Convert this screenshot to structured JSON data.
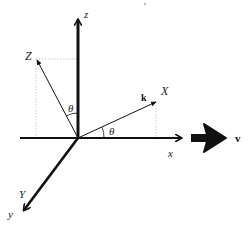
{
  "diagram": {
    "title": "",
    "labels": {
      "z_axis": "z",
      "x_axis": "x",
      "y_axis": "y",
      "Z_rotated": "Z",
      "X_rotated": "X",
      "Y_rotated": "Y",
      "theta_upper": "θ",
      "theta_lower": "θ",
      "wave_vector": "k",
      "velocity": "v"
    },
    "top_mark": ","
  }
}
